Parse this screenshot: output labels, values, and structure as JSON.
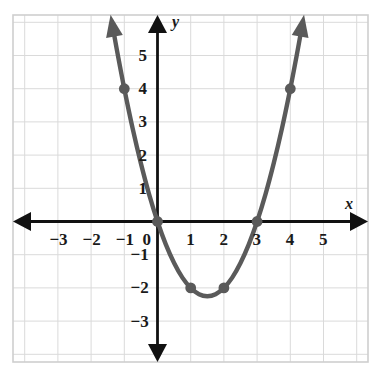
{
  "chart_data": {
    "type": "line",
    "title": "",
    "xlabel": "x",
    "ylabel": "y",
    "function": "y = x^2 - 3x",
    "xlim": [
      -3.8,
      5.8
    ],
    "ylim": [
      -3.8,
      5.8
    ],
    "grid": true,
    "legend": "none",
    "axis_color": "#111111",
    "curve_color": "#5a5a5a",
    "point_color": "#5a5a5a",
    "grid_color": "#d9d9d9",
    "background": "#ffffff",
    "vertex": {
      "x": 1.5,
      "y": -2.25
    },
    "x_ticks": [
      {
        "value": -3,
        "label": "−3"
      },
      {
        "value": -2,
        "label": "−2"
      },
      {
        "value": -1,
        "label": "−1"
      },
      {
        "value": 0,
        "label": "0"
      },
      {
        "value": 1,
        "label": "1"
      },
      {
        "value": 2,
        "label": "2"
      },
      {
        "value": 3,
        "label": "3"
      },
      {
        "value": 4,
        "label": "4"
      },
      {
        "value": 5,
        "label": "5"
      }
    ],
    "y_ticks": [
      {
        "value": 5,
        "label": "5"
      },
      {
        "value": 4,
        "label": "4"
      },
      {
        "value": 3,
        "label": "3"
      },
      {
        "value": 2,
        "label": "2"
      },
      {
        "value": 1,
        "label": "1"
      },
      {
        "value": -1,
        "label": "−1"
      },
      {
        "value": -2,
        "label": "−2"
      },
      {
        "value": -3,
        "label": "−3"
      }
    ],
    "marked_points": [
      {
        "x": -1,
        "y": 4
      },
      {
        "x": 0,
        "y": 0
      },
      {
        "x": 1,
        "y": -2
      },
      {
        "x": 2,
        "y": -2
      },
      {
        "x": 3,
        "y": 0
      },
      {
        "x": 4,
        "y": 4
      }
    ],
    "curve_points": [
      {
        "x": -1.35,
        "y": 5.87
      },
      {
        "x": -1.2,
        "y": 5.04
      },
      {
        "x": -1.0,
        "y": 4.0
      },
      {
        "x": -0.75,
        "y": 2.81
      },
      {
        "x": -0.5,
        "y": 1.75
      },
      {
        "x": -0.25,
        "y": 0.81
      },
      {
        "x": 0.0,
        "y": 0.0
      },
      {
        "x": 0.25,
        "y": -0.69
      },
      {
        "x": 0.5,
        "y": -1.25
      },
      {
        "x": 0.75,
        "y": -1.69
      },
      {
        "x": 1.0,
        "y": -2.0
      },
      {
        "x": 1.25,
        "y": -2.19
      },
      {
        "x": 1.5,
        "y": -2.25
      },
      {
        "x": 1.75,
        "y": -2.19
      },
      {
        "x": 2.0,
        "y": -2.0
      },
      {
        "x": 2.25,
        "y": -1.69
      },
      {
        "x": 2.5,
        "y": -1.25
      },
      {
        "x": 2.75,
        "y": -0.69
      },
      {
        "x": 3.0,
        "y": 0.0
      },
      {
        "x": 3.25,
        "y": 0.81
      },
      {
        "x": 3.5,
        "y": 1.75
      },
      {
        "x": 3.75,
        "y": 2.81
      },
      {
        "x": 4.0,
        "y": 4.0
      },
      {
        "x": 4.2,
        "y": 5.04
      },
      {
        "x": 4.35,
        "y": 5.87
      }
    ],
    "arrows": [
      {
        "name": "x-axis-arrow-right",
        "direction": "right"
      },
      {
        "name": "x-axis-arrow-left",
        "direction": "left"
      },
      {
        "name": "y-axis-arrow-up",
        "direction": "up"
      },
      {
        "name": "y-axis-arrow-down",
        "direction": "down"
      },
      {
        "name": "curve-arrow-left",
        "direction": "up-left"
      },
      {
        "name": "curve-arrow-right",
        "direction": "up-right"
      }
    ]
  }
}
